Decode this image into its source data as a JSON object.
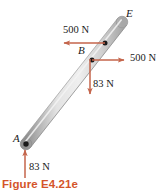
{
  "figure": {
    "caption": "Figure E4.21e",
    "caption_color": "#d4542a",
    "arrow_color": "#c4654b",
    "rod_color_light": "#e6e6e6",
    "rod_color_mid": "#c9c9c9",
    "rod_color_dark": "#9a9a9a",
    "points": [
      {
        "id": "A",
        "label": "A",
        "x": 26,
        "y": 144,
        "label_x": 13,
        "label_y": 134
      },
      {
        "id": "B",
        "label": "B",
        "x": 92,
        "y": 60,
        "label_x": 79,
        "label_y": 46
      },
      {
        "id": "E",
        "label": "E",
        "x": 122,
        "y": 22,
        "label_x": 127,
        "label_y": 10
      },
      {
        "id": "C",
        "label": "",
        "x": 105,
        "y": 43,
        "label_x": 0,
        "label_y": 0
      }
    ],
    "forces": [
      {
        "id": "force-upper-left",
        "label": "500 N",
        "magnitude": 500,
        "unit": "N",
        "direction": "left",
        "tail_x": 105,
        "tail_y": 43,
        "head_x": 62,
        "head_y": 43,
        "label_x": 63,
        "label_y": 26
      },
      {
        "id": "force-right-at-b",
        "label": "500 N",
        "magnitude": 500,
        "unit": "N",
        "direction": "right",
        "tail_x": 92,
        "tail_y": 60,
        "head_x": 126,
        "head_y": 60,
        "label_x": 130,
        "label_y": 53
      },
      {
        "id": "force-down-at-b",
        "label": "83 N",
        "magnitude": 83,
        "unit": "N",
        "direction": "down",
        "tail_x": 90,
        "tail_y": 60,
        "head_x": 90,
        "head_y": 96,
        "label_x": 94,
        "label_y": 79
      },
      {
        "id": "force-up-at-a",
        "label": "83 N",
        "magnitude": 83,
        "unit": "N",
        "direction": "up",
        "tail_x": 25,
        "tail_y": 178,
        "head_x": 25,
        "head_y": 148,
        "label_x": 30,
        "label_y": 162
      }
    ],
    "rod": {
      "start_x": 26,
      "start_y": 144,
      "end_x": 122,
      "end_y": 22,
      "width": 11
    }
  }
}
